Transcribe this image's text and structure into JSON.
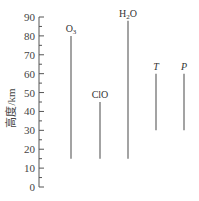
{
  "chart_data": {
    "type": "range-bar",
    "title": "",
    "xlabel": "",
    "ylabel": "高度/km",
    "ylim": [
      0,
      90
    ],
    "yticks": [
      0,
      10,
      20,
      30,
      40,
      50,
      60,
      70,
      80,
      90
    ],
    "grid": false,
    "legend": null,
    "series": [
      {
        "name": "O3",
        "label_main": "O",
        "label_sub": "3",
        "label_italic": false,
        "low": 15,
        "high": 80
      },
      {
        "name": "ClO",
        "label_main": "ClO",
        "label_sub": "",
        "label_italic": false,
        "low": 15,
        "high": 45
      },
      {
        "name": "H2O",
        "label_main": "H",
        "label_sub": "2",
        "label_tail": "O",
        "label_italic": false,
        "low": 15,
        "high": 88
      },
      {
        "name": "T",
        "label_main": "T",
        "label_sub": "",
        "label_italic": true,
        "low": 30,
        "high": 60
      },
      {
        "name": "P",
        "label_main": "P",
        "label_sub": "",
        "label_italic": true,
        "low": 30,
        "high": 60
      }
    ]
  },
  "colors": {
    "axis": "#555555",
    "line": "#666666",
    "text": "#333333"
  }
}
